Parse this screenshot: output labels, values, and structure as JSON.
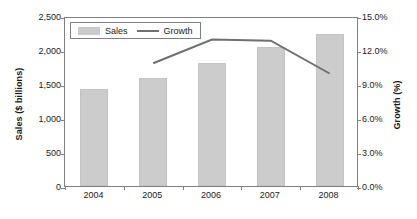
{
  "chart_data": {
    "type": "bar",
    "title": "",
    "xlabel": "",
    "ylabel": "Sales ($ billions)",
    "y2label": "Growth (%)",
    "categories": [
      "2004",
      "2005",
      "2006",
      "2007",
      "2008"
    ],
    "grid": false,
    "legend_position": "top-left",
    "ylim": [
      0,
      2500
    ],
    "y2lim": [
      0,
      15
    ],
    "ytick_labels": [
      "0",
      "500",
      "1,000",
      "1,500",
      "2,000",
      "2,500"
    ],
    "ytick_values": [
      0,
      500,
      1000,
      1500,
      2000,
      2500
    ],
    "y2tick_labels": [
      "0.0%",
      "3.0%",
      "6.0%",
      "9.0%",
      "12.0%",
      "15.0%"
    ],
    "y2tick_values": [
      0,
      3,
      6,
      9,
      12,
      15
    ],
    "series": [
      {
        "name": "Sales",
        "type": "bar",
        "axis": "left",
        "color": "#cccccc",
        "values": [
          1430,
          1590,
          1810,
          2045,
          2235
        ]
      },
      {
        "name": "Growth",
        "type": "line",
        "axis": "right",
        "color": "#707070",
        "values": [
          null,
          11.0,
          13.1,
          13.0,
          10.1
        ]
      }
    ]
  },
  "legend": {
    "items": [
      {
        "label": "Sales",
        "marker": "bar-swatch-icon"
      },
      {
        "label": "Growth",
        "marker": "line-swatch-icon"
      }
    ]
  },
  "axes": {
    "left_title": "Sales ($ billions)",
    "right_title": "Growth (%)"
  },
  "colors": {
    "bar": "#cccccc",
    "line": "#707070",
    "frame": "#808080",
    "text": "#1a1a1a",
    "background": "#ffffff"
  }
}
